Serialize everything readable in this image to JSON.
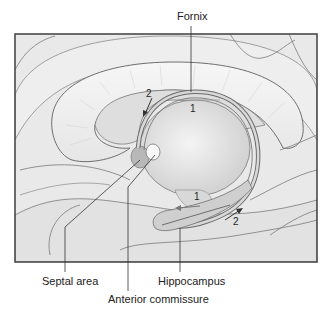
{
  "figure": {
    "type": "anatomical-diagram",
    "colors": {
      "background": "#ffffff",
      "frame": "#4a4a4a",
      "tissue_light": "#ececec",
      "tissue_mid": "#d9d9d9",
      "tissue_dark": "#bdbdbd",
      "outline": "#6e6e6e",
      "leader_line": "#333333"
    }
  },
  "labels": {
    "fornix": "Fornix",
    "septal_area": "Septal area",
    "anterior_commissure": "Anterior commissure",
    "hippocampus": "Hippocampus"
  },
  "arrows": {
    "upper_1": "1",
    "upper_2": "2",
    "lower_1": "1",
    "lower_2": "2"
  }
}
